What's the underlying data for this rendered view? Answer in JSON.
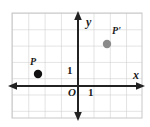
{
  "figure": {
    "kind": "coordinate-plane-diagram",
    "width": 150,
    "height": 127,
    "background": "#ffffff"
  },
  "grid": {
    "cell_size": 16.3,
    "left": 12,
    "top": 13,
    "right": 142,
    "bottom": 118,
    "line_color": "#c8c8c8",
    "show": true
  },
  "axes": {
    "origin": {
      "x": 78,
      "y": 86
    },
    "color": "#222222",
    "x_axis": {
      "label": "x",
      "label_name": "x-axis-label",
      "arrow_left": true,
      "arrow_right": true,
      "y": 86,
      "x_start": 8,
      "x_end": 144
    },
    "y_axis": {
      "label": "y",
      "label_name": "y-axis-label",
      "arrow_up": true,
      "arrow_down": true,
      "x": 78,
      "y_start": 11,
      "y_end": 120
    },
    "origin_label": "O",
    "tick_labels": {
      "x_one": "1",
      "y_one": "1"
    }
  },
  "points": [
    {
      "id": "P",
      "label": "P",
      "color": "#111111",
      "radius": 4.2,
      "px": {
        "x": 38,
        "y": 74
      },
      "coords": {
        "x": -2.5,
        "y": 0.75
      }
    },
    {
      "id": "P-prime",
      "label": "P'",
      "color": "#8a8a8a",
      "radius": 4.2,
      "px": {
        "x": 107,
        "y": 44
      },
      "coords": {
        "x": 1.8,
        "y": 2.6
      }
    }
  ]
}
